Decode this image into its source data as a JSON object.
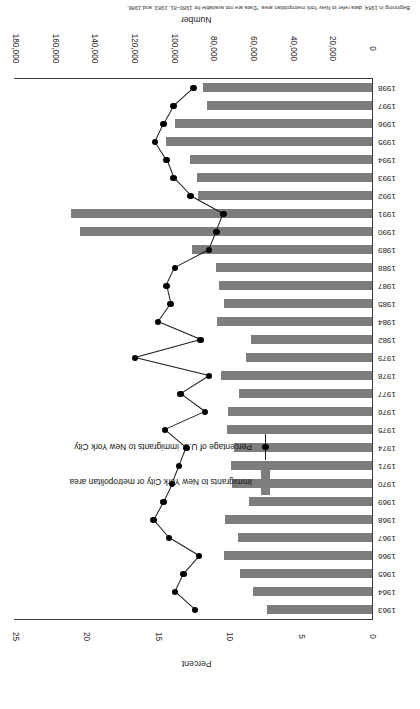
{
  "chart_data": {
    "type": "bar",
    "title": "",
    "xlabel": "Number",
    "ylabel": "Percent",
    "grid": false,
    "legend_position": "middle-left",
    "bar_color": "#7d7d7d",
    "line_color": "#1a1a1a",
    "number_axis": {
      "label": "Number",
      "ticks": [
        "0",
        "20,000",
        "40,000",
        "60,000",
        "80,000",
        "100,000",
        "120,000",
        "140,000",
        "160,000",
        "180,000"
      ],
      "tick_values": [
        0,
        20000,
        40000,
        60000,
        80000,
        100000,
        120000,
        140000,
        160000,
        180000
      ],
      "range": [
        0,
        180000
      ]
    },
    "percent_axis": {
      "label": "Percent",
      "ticks": [
        "0",
        "5",
        "10",
        "15",
        "20",
        "25"
      ],
      "tick_values": [
        0,
        5,
        10,
        15,
        20,
        25
      ],
      "range": [
        0,
        25
      ]
    },
    "categories": [
      "1963",
      "1964",
      "1965",
      "1966",
      "1967",
      "1968",
      "1969",
      "1970",
      "1971",
      "1974",
      "1975",
      "1976",
      "1977",
      "1978",
      "1979",
      "1982",
      "1984",
      "1985",
      "1987",
      "1988",
      "1989",
      "1990",
      "1991",
      "1992",
      "1993",
      "1994",
      "1995",
      "1996",
      "1997",
      "1998"
    ],
    "series": [
      {
        "name": "Immigrants to New York City or metropolitan area",
        "type": "bar",
        "axis": "number",
        "values": [
          53000,
          60000,
          66500,
          74500,
          67500,
          74000,
          62000,
          70500,
          71000,
          69500,
          73000,
          72500,
          67000,
          76000,
          63500,
          61000,
          78000,
          74500,
          77000,
          78500,
          91000,
          147000,
          152000,
          87500,
          88000,
          92000,
          104000,
          99500,
          83000,
          85000
        ]
      },
      {
        "name": "Percentage of U.S. immigrants to New York City",
        "type": "line",
        "axis": "percent",
        "values": [
          12.4,
          13.8,
          13.2,
          12.1,
          14.2,
          15.3,
          14.6,
          14.0,
          13.5,
          13.0,
          14.5,
          11.7,
          13.4,
          11.4,
          16.6,
          12.0,
          15.0,
          14.1,
          14.4,
          13.8,
          11.4,
          10.9,
          10.4,
          12.7,
          13.9,
          14.4,
          15.2,
          14.6,
          13.9,
          12.5
        ]
      }
    ]
  },
  "legend": {
    "entries": [
      {
        "label": "Immigrants to New York City or metropolitan area",
        "marker": "bar-swatch"
      },
      {
        "label": "Percentage of U.S. immigrants to New York City",
        "marker": "line-point"
      }
    ]
  },
  "footnote": {
    "text": "Beginning in 1984, data refer to New York metropolitan area. *Data are not available for 1980–81, 1983, and 1986."
  }
}
